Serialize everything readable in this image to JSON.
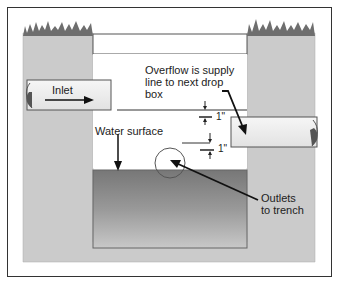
{
  "diagram": {
    "labels": {
      "inlet": "Inlet",
      "overflow_line1": "Overflow is supply",
      "overflow_line2": "line to next drop",
      "overflow_line3": "box",
      "water_surface": "Water surface",
      "dimension_upper": "1\"",
      "dimension_lower": "1\"",
      "outlets_line1": "Outlets",
      "outlets_line2": "to trench"
    },
    "colors": {
      "soil": "#c9c9c9",
      "grass": "#6e6e6e",
      "water_top": "#7a7a7a",
      "water_bottom": "#bdbdbd",
      "pipe": "#f0f0f0",
      "outline": "#333333",
      "frame": "#333333"
    }
  }
}
